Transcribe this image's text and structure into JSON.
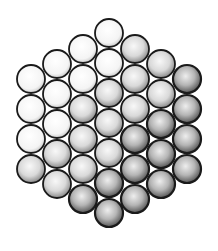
{
  "diagram": {
    "type": "hexagonal close-packed circles (wire strand cross-section)",
    "background": "#ffffff",
    "stroke_color": "#1a1a1a",
    "circle_radius": 14,
    "columns": [
      {
        "x": 31,
        "ys": [
          79,
          109,
          139,
          169
        ]
      },
      {
        "x": 57,
        "ys": [
          64,
          94,
          124,
          154,
          184
        ]
      },
      {
        "x": 83,
        "ys": [
          49,
          79,
          109,
          139,
          169,
          199
        ]
      },
      {
        "x": 109,
        "ys": [
          33,
          63,
          93,
          123,
          153,
          183,
          213
        ]
      },
      {
        "x": 135,
        "ys": [
          49,
          79,
          109,
          139,
          169,
          199
        ]
      },
      {
        "x": 161,
        "ys": [
          64,
          94,
          124,
          154,
          184
        ]
      },
      {
        "x": 187,
        "ys": [
          79,
          109,
          139,
          169
        ]
      }
    ],
    "circle_count": 37,
    "shading": "stippled, darker toward lower-right"
  }
}
